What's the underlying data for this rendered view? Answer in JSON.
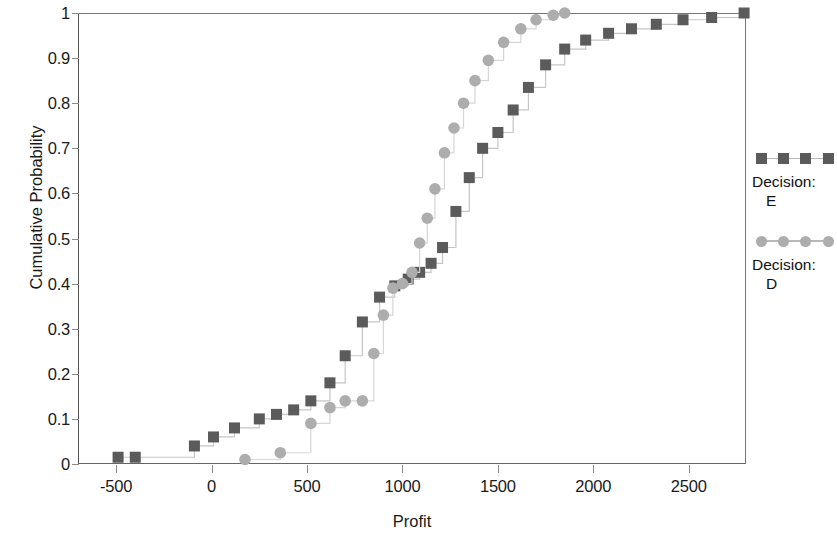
{
  "chart_data": {
    "type": "line",
    "title": "",
    "xlabel": "Profit",
    "ylabel": "Cumulative Probability",
    "xlim": [
      -700,
      2800
    ],
    "ylim": [
      0,
      1
    ],
    "xticks": [
      -500,
      0,
      500,
      1000,
      1500,
      2000,
      2500
    ],
    "xtick_labels": [
      "-500",
      "0",
      "500",
      "1000",
      "1500",
      "2000",
      "2500"
    ],
    "yticks": [
      0,
      0.1,
      0.2,
      0.3,
      0.4,
      0.5,
      0.6,
      0.7,
      0.8,
      0.9,
      1
    ],
    "ytick_labels": [
      "0",
      "0.1",
      "0.2",
      "0.3",
      "0.4",
      "0.5",
      "0.6",
      "0.7",
      "0.8",
      "0.9",
      "1"
    ],
    "grid": false,
    "legend_position": "right",
    "step_style": "step-after",
    "series": [
      {
        "name": "Decision: E",
        "marker": "square",
        "color": "#5b5b5b",
        "line_color": "#c6c6c6",
        "x": [
          -490,
          -400,
          -90,
          10,
          120,
          250,
          340,
          430,
          520,
          620,
          700,
          790,
          880,
          960,
          1030,
          1090,
          1150,
          1210,
          1280,
          1350,
          1420,
          1500,
          1580,
          1660,
          1750,
          1850,
          1960,
          2080,
          2200,
          2330,
          2470,
          2620,
          2790
        ],
        "y": [
          0.015,
          0.015,
          0.04,
          0.06,
          0.08,
          0.1,
          0.11,
          0.12,
          0.14,
          0.18,
          0.24,
          0.315,
          0.37,
          0.395,
          0.41,
          0.425,
          0.445,
          0.48,
          0.56,
          0.635,
          0.7,
          0.735,
          0.785,
          0.835,
          0.885,
          0.92,
          0.94,
          0.955,
          0.965,
          0.975,
          0.985,
          0.99,
          1.0
        ]
      },
      {
        "name": "Decision: D",
        "marker": "circle",
        "color": "#adadad",
        "line_color": "#d6d6d6",
        "x": [
          175,
          360,
          520,
          620,
          700,
          790,
          850,
          900,
          950,
          1000,
          1050,
          1090,
          1130,
          1170,
          1220,
          1270,
          1320,
          1380,
          1450,
          1530,
          1620,
          1700,
          1790,
          1850
        ],
        "y": [
          0.01,
          0.025,
          0.09,
          0.125,
          0.14,
          0.14,
          0.245,
          0.33,
          0.39,
          0.4,
          0.425,
          0.49,
          0.545,
          0.61,
          0.69,
          0.745,
          0.8,
          0.85,
          0.895,
          0.935,
          0.965,
          0.985,
          0.995,
          1.0
        ]
      }
    ]
  },
  "legend": {
    "entries": [
      {
        "line1": "Decision:",
        "line2": "E",
        "marker": "square-marker"
      },
      {
        "line1": "Decision:",
        "line2": "D",
        "marker": "circle-marker"
      }
    ]
  }
}
